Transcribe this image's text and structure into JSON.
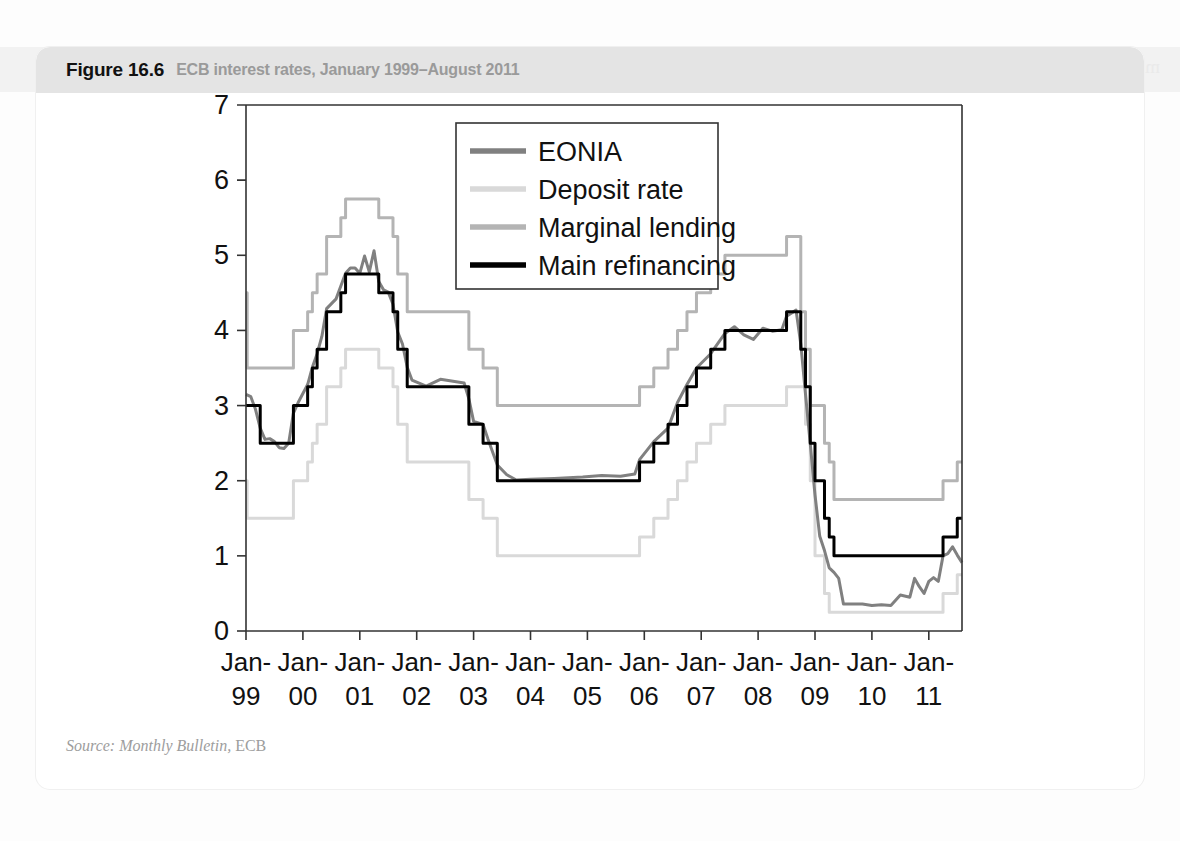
{
  "figure": {
    "number": "Figure 16.6",
    "subtitle": "ECB interest rates, January 1999–August 2011",
    "source_prefix": "Source: Monthly Bulletin,",
    "source_suffix": "ECB"
  },
  "bleed_text": "mrofer dna ytilibats ecirp erom .eroM evah uoy sihT",
  "colors": {
    "eonia": "#808080",
    "deposit": "#d9d9d9",
    "marginal": "#b4b4b4",
    "main_refi": "#000000",
    "axis": "#333333",
    "header_band": "#e4e4e4",
    "card": "#ffffff",
    "page": "#fdfdfd"
  },
  "chart_data": {
    "type": "line",
    "title": "ECB interest rates, January 1999–August 2011",
    "xlabel": "",
    "ylabel": "",
    "ylim": [
      0,
      7
    ],
    "yticks": [
      0,
      1,
      2,
      3,
      4,
      5,
      6,
      7
    ],
    "ytick_labels": [
      "0",
      "1",
      "2",
      "3",
      "4",
      "5",
      "6",
      "7"
    ],
    "xlim": [
      "1999-01",
      "2011-08"
    ],
    "xticks": [
      "1999-01",
      "2000-01",
      "2001-01",
      "2002-01",
      "2003-01",
      "2004-01",
      "2005-01",
      "2006-01",
      "2007-01",
      "2008-01",
      "2009-01",
      "2010-01",
      "2011-01"
    ],
    "xtick_labels": [
      [
        "Jan-",
        "99"
      ],
      [
        "Jan-",
        "00"
      ],
      [
        "Jan-",
        "01"
      ],
      [
        "Jan-",
        "02"
      ],
      [
        "Jan-",
        "03"
      ],
      [
        "Jan-",
        "04"
      ],
      [
        "Jan-",
        "05"
      ],
      [
        "Jan-",
        "06"
      ],
      [
        "Jan-",
        "07"
      ],
      [
        "Jan-",
        "08"
      ],
      [
        "Jan-",
        "09"
      ],
      [
        "Jan-",
        "10"
      ],
      [
        "Jan-",
        "11"
      ]
    ],
    "grid": false,
    "legend_position": "upper-center",
    "legend": [
      "EONIA",
      "Deposit rate",
      "Marginal lending",
      "Main refinancing"
    ],
    "units": "percent per annum",
    "series": [
      {
        "name": "Main refinancing",
        "color": "#000000",
        "width": 3.0,
        "style": "step",
        "points": [
          [
            "1999-01",
            3.0
          ],
          [
            "1999-04",
            2.5
          ],
          [
            "1999-11",
            3.0
          ],
          [
            "2000-02",
            3.25
          ],
          [
            "2000-03",
            3.5
          ],
          [
            "2000-04",
            3.75
          ],
          [
            "2000-06",
            4.25
          ],
          [
            "2000-09",
            4.5
          ],
          [
            "2000-10",
            4.75
          ],
          [
            "2001-05",
            4.5
          ],
          [
            "2001-08",
            4.25
          ],
          [
            "2001-09",
            3.75
          ],
          [
            "2001-11",
            3.25
          ],
          [
            "2002-12",
            2.75
          ],
          [
            "2003-03",
            2.5
          ],
          [
            "2003-06",
            2.0
          ],
          [
            "2005-12",
            2.25
          ],
          [
            "2006-03",
            2.5
          ],
          [
            "2006-06",
            2.75
          ],
          [
            "2006-08",
            3.0
          ],
          [
            "2006-10",
            3.25
          ],
          [
            "2006-12",
            3.5
          ],
          [
            "2007-03",
            3.75
          ],
          [
            "2007-06",
            4.0
          ],
          [
            "2008-07",
            4.25
          ],
          [
            "2008-10",
            3.75
          ],
          [
            "2008-11",
            3.25
          ],
          [
            "2008-12",
            2.5
          ],
          [
            "2009-01",
            2.0
          ],
          [
            "2009-03",
            1.5
          ],
          [
            "2009-04",
            1.25
          ],
          [
            "2009-05",
            1.0
          ],
          [
            "2011-04",
            1.25
          ],
          [
            "2011-07",
            1.5
          ],
          [
            "2011-08",
            1.5
          ]
        ]
      },
      {
        "name": "Marginal lending",
        "color": "#b4b4b4",
        "width": 3.0,
        "style": "step",
        "points": [
          [
            "1999-01",
            4.5
          ],
          [
            "1999-01b",
            3.5
          ],
          [
            "1999-04",
            3.5
          ],
          [
            "1999-11",
            4.0
          ],
          [
            "2000-02",
            4.25
          ],
          [
            "2000-03",
            4.5
          ],
          [
            "2000-04",
            4.75
          ],
          [
            "2000-06",
            5.25
          ],
          [
            "2000-09",
            5.5
          ],
          [
            "2000-10",
            5.75
          ],
          [
            "2001-05",
            5.5
          ],
          [
            "2001-08",
            5.25
          ],
          [
            "2001-09",
            4.75
          ],
          [
            "2001-11",
            4.25
          ],
          [
            "2002-12",
            3.75
          ],
          [
            "2003-03",
            3.5
          ],
          [
            "2003-06",
            3.0
          ],
          [
            "2005-12",
            3.25
          ],
          [
            "2006-03",
            3.5
          ],
          [
            "2006-06",
            3.75
          ],
          [
            "2006-08",
            4.0
          ],
          [
            "2006-10",
            4.25
          ],
          [
            "2006-12",
            4.5
          ],
          [
            "2007-03",
            4.75
          ],
          [
            "2007-06",
            5.0
          ],
          [
            "2008-07",
            5.25
          ],
          [
            "2008-10",
            4.25
          ],
          [
            "2008-11",
            3.75
          ],
          [
            "2008-12",
            3.0
          ],
          [
            "2009-01",
            3.0
          ],
          [
            "2009-03",
            2.5
          ],
          [
            "2009-04",
            2.25
          ],
          [
            "2009-05",
            1.75
          ],
          [
            "2011-04",
            2.0
          ],
          [
            "2011-07",
            2.25
          ],
          [
            "2011-08",
            2.25
          ]
        ]
      },
      {
        "name": "Deposit rate",
        "color": "#d9d9d9",
        "width": 3.0,
        "style": "step",
        "points": [
          [
            "1999-01",
            2.0
          ],
          [
            "1999-01b",
            1.5
          ],
          [
            "1999-04",
            1.5
          ],
          [
            "1999-11",
            2.0
          ],
          [
            "2000-02",
            2.25
          ],
          [
            "2000-03",
            2.5
          ],
          [
            "2000-04",
            2.75
          ],
          [
            "2000-06",
            3.25
          ],
          [
            "2000-09",
            3.5
          ],
          [
            "2000-10",
            3.75
          ],
          [
            "2001-05",
            3.5
          ],
          [
            "2001-08",
            3.25
          ],
          [
            "2001-09",
            2.75
          ],
          [
            "2001-11",
            2.25
          ],
          [
            "2002-12",
            1.75
          ],
          [
            "2003-03",
            1.5
          ],
          [
            "2003-06",
            1.0
          ],
          [
            "2005-12",
            1.25
          ],
          [
            "2006-03",
            1.5
          ],
          [
            "2006-06",
            1.75
          ],
          [
            "2006-08",
            2.0
          ],
          [
            "2006-10",
            2.25
          ],
          [
            "2006-12",
            2.5
          ],
          [
            "2007-03",
            2.75
          ],
          [
            "2007-06",
            3.0
          ],
          [
            "2008-07",
            3.25
          ],
          [
            "2008-10",
            3.25
          ],
          [
            "2008-11",
            2.75
          ],
          [
            "2008-12",
            2.0
          ],
          [
            "2009-01",
            1.0
          ],
          [
            "2009-03",
            0.5
          ],
          [
            "2009-04",
            0.25
          ],
          [
            "2009-05",
            0.25
          ],
          [
            "2011-04",
            0.5
          ],
          [
            "2011-07",
            0.75
          ],
          [
            "2011-08",
            0.75
          ]
        ]
      },
      {
        "name": "EONIA",
        "color": "#808080",
        "width": 3.0,
        "style": "noisy",
        "points": [
          [
            "1999-01",
            3.15
          ],
          [
            "1999-02",
            3.12
          ],
          [
            "1999-03",
            2.95
          ],
          [
            "1999-04",
            2.7
          ],
          [
            "1999-05",
            2.55
          ],
          [
            "1999-06",
            2.56
          ],
          [
            "1999-07",
            2.52
          ],
          [
            "1999-08",
            2.44
          ],
          [
            "1999-09",
            2.43
          ],
          [
            "1999-10",
            2.5
          ],
          [
            "1999-11",
            2.9
          ],
          [
            "1999-12",
            3.04
          ],
          [
            "2000-02",
            3.28
          ],
          [
            "2000-03",
            3.51
          ],
          [
            "2000-04",
            3.69
          ],
          [
            "2000-05",
            3.92
          ],
          [
            "2000-06",
            4.29
          ],
          [
            "2000-08",
            4.42
          ],
          [
            "2000-09",
            4.59
          ],
          [
            "2000-10",
            4.76
          ],
          [
            "2000-11",
            4.83
          ],
          [
            "2000-12",
            4.83
          ],
          [
            "2001-01",
            4.76
          ],
          [
            "2001-02",
            4.99
          ],
          [
            "2001-03",
            4.78
          ],
          [
            "2001-04",
            5.06
          ],
          [
            "2001-05",
            4.65
          ],
          [
            "2001-06",
            4.54
          ],
          [
            "2001-07",
            4.51
          ],
          [
            "2001-08",
            4.35
          ],
          [
            "2001-09",
            3.98
          ],
          [
            "2001-10",
            3.82
          ],
          [
            "2001-11",
            3.51
          ],
          [
            "2001-12",
            3.34
          ],
          [
            "2002-03",
            3.26
          ],
          [
            "2002-06",
            3.35
          ],
          [
            "2002-09",
            3.32
          ],
          [
            "2002-11",
            3.3
          ],
          [
            "2002-12",
            3.09
          ],
          [
            "2003-01",
            2.79
          ],
          [
            "2003-03",
            2.75
          ],
          [
            "2003-04",
            2.56
          ],
          [
            "2003-06",
            2.21
          ],
          [
            "2003-08",
            2.08
          ],
          [
            "2003-10",
            2.01
          ],
          [
            "2004-01",
            2.02
          ],
          [
            "2004-06",
            2.03
          ],
          [
            "2004-12",
            2.05
          ],
          [
            "2005-04",
            2.07
          ],
          [
            "2005-08",
            2.06
          ],
          [
            "2005-11",
            2.09
          ],
          [
            "2005-12",
            2.28
          ],
          [
            "2006-03",
            2.52
          ],
          [
            "2006-06",
            2.7
          ],
          [
            "2006-08",
            3.04
          ],
          [
            "2006-10",
            3.28
          ],
          [
            "2006-12",
            3.5
          ],
          [
            "2007-03",
            3.69
          ],
          [
            "2007-06",
            3.96
          ],
          [
            "2007-08",
            4.05
          ],
          [
            "2007-10",
            3.94
          ],
          [
            "2007-12",
            3.88
          ],
          [
            "2008-02",
            4.03
          ],
          [
            "2008-04",
            3.99
          ],
          [
            "2008-06",
            4.01
          ],
          [
            "2008-07",
            4.19
          ],
          [
            "2008-09",
            4.27
          ],
          [
            "2008-10",
            3.82
          ],
          [
            "2008-11",
            3.15
          ],
          [
            "2008-12",
            2.49
          ],
          [
            "2009-01",
            1.81
          ],
          [
            "2009-02",
            1.26
          ],
          [
            "2009-03",
            1.07
          ],
          [
            "2009-04",
            0.84
          ],
          [
            "2009-05",
            0.78
          ],
          [
            "2009-06",
            0.7
          ],
          [
            "2009-07",
            0.36
          ],
          [
            "2009-09",
            0.36
          ],
          [
            "2009-11",
            0.36
          ],
          [
            "2010-01",
            0.34
          ],
          [
            "2010-03",
            0.35
          ],
          [
            "2010-05",
            0.34
          ],
          [
            "2010-07",
            0.48
          ],
          [
            "2010-09",
            0.45
          ],
          [
            "2010-10",
            0.7
          ],
          [
            "2010-11",
            0.59
          ],
          [
            "2010-12",
            0.5
          ],
          [
            "2011-01",
            0.66
          ],
          [
            "2011-02",
            0.71
          ],
          [
            "2011-03",
            0.66
          ],
          [
            "2011-04",
            1.0
          ],
          [
            "2011-05",
            1.03
          ],
          [
            "2011-06",
            1.12
          ],
          [
            "2011-07",
            1.01
          ],
          [
            "2011-08",
            0.91
          ]
        ]
      }
    ]
  }
}
